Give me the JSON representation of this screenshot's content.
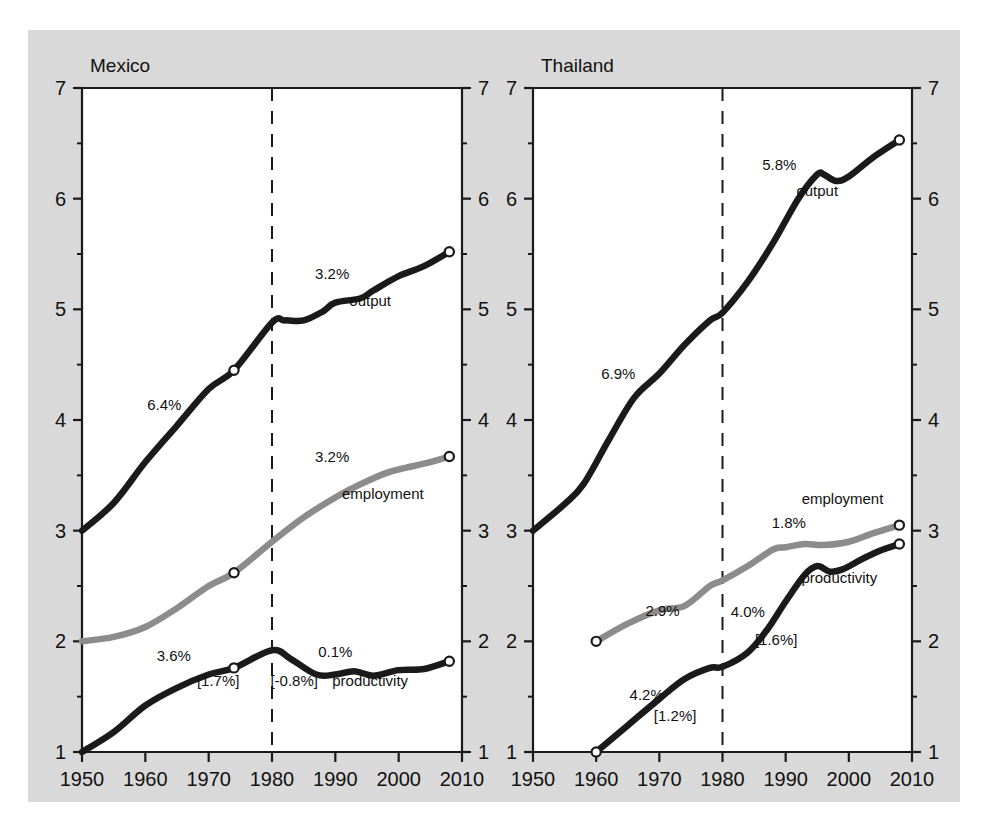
{
  "figure": {
    "background_color": "#d9d9d9",
    "plot_background_color": "#ffffff",
    "dark_line_color": "#1a1a1a",
    "gray_line_color": "#8c8c8c",
    "axis_color": "#1a1a1a"
  },
  "chart_data": [
    {
      "type": "line",
      "title": "Mexico",
      "xlabel": "",
      "ylabel": "",
      "xlim": [
        1950,
        2010
      ],
      "ylim": [
        1,
        7
      ],
      "grid": false,
      "legend": "inline-labels",
      "xticks": [
        1950,
        1960,
        1970,
        1980,
        1990,
        2000,
        2010
      ],
      "xtick_labels": [
        "1950",
        "1960",
        "1970",
        "1980",
        "1990",
        "2000",
        "2010"
      ],
      "yticks": [
        1,
        2,
        3,
        4,
        5,
        6,
        7
      ],
      "ytick_labels": [
        "1",
        "2",
        "3",
        "4",
        "5",
        "6",
        "7"
      ],
      "minor_yticks": [
        1.5,
        2.5,
        3.5,
        4.5,
        5.5,
        6.5
      ],
      "vertical_reference_line": 1980,
      "series": [
        {
          "name": "output",
          "color": "#1a1a1a",
          "x": [
            1950,
            1955,
            1960,
            1965,
            1970,
            1974,
            1980,
            1982,
            1985,
            1988,
            1990,
            1994,
            1996,
            2000,
            2004,
            2008
          ],
          "values": [
            3.0,
            3.25,
            3.62,
            3.95,
            4.28,
            4.45,
            4.88,
            4.9,
            4.9,
            4.98,
            5.06,
            5.1,
            5.17,
            5.3,
            5.39,
            5.52
          ]
        },
        {
          "name": "employment",
          "color": "#8c8c8c",
          "x": [
            1950,
            1955,
            1960,
            1965,
            1970,
            1974,
            1980,
            1985,
            1990,
            1994,
            1998,
            2002,
            2005,
            2008
          ],
          "values": [
            2.0,
            2.04,
            2.13,
            2.3,
            2.5,
            2.62,
            2.9,
            3.12,
            3.3,
            3.42,
            3.52,
            3.58,
            3.62,
            3.67
          ]
        },
        {
          "name": "productivity",
          "color": "#1a1a1a",
          "x": [
            1950,
            1955,
            1960,
            1965,
            1970,
            1974,
            1980,
            1983,
            1987,
            1990,
            1993,
            1996,
            2000,
            2004,
            2008
          ],
          "values": [
            1.0,
            1.18,
            1.42,
            1.58,
            1.7,
            1.76,
            1.92,
            1.84,
            1.7,
            1.7,
            1.73,
            1.69,
            1.74,
            1.75,
            1.82
          ]
        }
      ],
      "markers": [
        {
          "series": "output",
          "x": 1974,
          "y": 4.45
        },
        {
          "series": "output",
          "x": 2008,
          "y": 5.52
        },
        {
          "series": "employment",
          "x": 1974,
          "y": 2.62
        },
        {
          "series": "employment",
          "x": 2008,
          "y": 3.67
        },
        {
          "series": "productivity",
          "x": 1974,
          "y": 1.76
        },
        {
          "series": "productivity",
          "x": 2008,
          "y": 1.82
        }
      ],
      "annotations": [
        {
          "text": "6.4%",
          "x": 1963.0,
          "y": 4.09,
          "series": "output"
        },
        {
          "text": "3.2%",
          "x": 1989.5,
          "y": 5.27,
          "series": "output"
        },
        {
          "text": "output",
          "x": 1995.5,
          "y": 5.03,
          "series": "output"
        },
        {
          "text": "3.2%",
          "x": 1989.5,
          "y": 3.62,
          "series": "employment"
        },
        {
          "text": "employment",
          "x": 1997.5,
          "y": 3.29,
          "series": "employment"
        },
        {
          "text": "3.6%",
          "x": 1964.5,
          "y": 1.82,
          "series": "productivity"
        },
        {
          "text": "[1.7%]",
          "x": 1971.5,
          "y": 1.6,
          "series": "productivity"
        },
        {
          "text": "0.1%",
          "x": 1990.0,
          "y": 1.86,
          "series": "productivity"
        },
        {
          "text": "[-0.8%]",
          "x": 1983.5,
          "y": 1.6,
          "series": "productivity"
        },
        {
          "text": "productivity",
          "x": 1995.5,
          "y": 1.6,
          "series": "productivity"
        }
      ]
    },
    {
      "type": "line",
      "title": "Thailand",
      "xlabel": "",
      "ylabel": "",
      "xlim": [
        1950,
        2010
      ],
      "ylim": [
        1,
        7
      ],
      "grid": false,
      "legend": "inline-labels",
      "xticks": [
        1950,
        1960,
        1970,
        1980,
        1990,
        2000,
        2010
      ],
      "xtick_labels": [
        "1950",
        "1960",
        "1970",
        "1980",
        "1990",
        "2000",
        "2010"
      ],
      "yticks": [
        1,
        2,
        3,
        4,
        5,
        6,
        7
      ],
      "ytick_labels": [
        "1",
        "2",
        "3",
        "4",
        "5",
        "6",
        "7"
      ],
      "minor_yticks": [
        1.5,
        2.5,
        3.5,
        4.5,
        5.5,
        6.5
      ],
      "vertical_reference_line": 1980,
      "series": [
        {
          "name": "output",
          "color": "#1a1a1a",
          "x": [
            1950,
            1955,
            1958,
            1962,
            1966,
            1970,
            1974,
            1978,
            1980,
            1984,
            1988,
            1992,
            1995,
            1996,
            1998,
            2000,
            2004,
            2008
          ],
          "values": [
            3.0,
            3.24,
            3.42,
            3.82,
            4.2,
            4.42,
            4.68,
            4.9,
            4.97,
            5.25,
            5.6,
            6.0,
            6.22,
            6.22,
            6.16,
            6.2,
            6.38,
            6.53
          ]
        },
        {
          "name": "employment",
          "color": "#8c8c8c",
          "x": [
            1960,
            1965,
            1970,
            1974,
            1978,
            1980,
            1984,
            1988,
            1990,
            1993,
            1996,
            2000,
            2004,
            2008
          ],
          "values": [
            2.0,
            2.16,
            2.28,
            2.32,
            2.5,
            2.55,
            2.68,
            2.83,
            2.85,
            2.88,
            2.87,
            2.9,
            2.98,
            3.05
          ]
        },
        {
          "name": "productivity",
          "color": "#1a1a1a",
          "x": [
            1960,
            1965,
            1970,
            1974,
            1978,
            1980,
            1984,
            1987,
            1990,
            1993,
            1995,
            1997,
            1999,
            2002,
            2005,
            2008
          ],
          "values": [
            1.0,
            1.24,
            1.48,
            1.66,
            1.76,
            1.77,
            1.9,
            2.1,
            2.36,
            2.6,
            2.68,
            2.63,
            2.65,
            2.74,
            2.82,
            2.88
          ]
        }
      ],
      "markers": [
        {
          "series": "output",
          "x": 2008,
          "y": 6.53
        },
        {
          "series": "employment",
          "x": 1960,
          "y": 2.0
        },
        {
          "series": "employment",
          "x": 2008,
          "y": 3.05
        },
        {
          "series": "productivity",
          "x": 1960,
          "y": 1.0
        },
        {
          "series": "productivity",
          "x": 2008,
          "y": 2.88
        }
      ],
      "annotations": [
        {
          "text": "6.9%",
          "x": 1963.5,
          "y": 4.37,
          "series": "output"
        },
        {
          "text": "5.8%",
          "x": 1989.0,
          "y": 6.26,
          "series": "output"
        },
        {
          "text": "output",
          "x": 1995.0,
          "y": 6.02,
          "series": "output"
        },
        {
          "text": "employment",
          "x": 1999.0,
          "y": 3.24,
          "series": "employment"
        },
        {
          "text": "1.8%",
          "x": 1990.5,
          "y": 3.02,
          "series": "employment"
        },
        {
          "text": "2.9%",
          "x": 1970.5,
          "y": 2.23,
          "series": "employment"
        },
        {
          "text": "4.0%",
          "x": 1984.0,
          "y": 2.22,
          "series": "productivity"
        },
        {
          "text": "[1.6%]",
          "x": 1988.5,
          "y": 1.97,
          "series": "productivity"
        },
        {
          "text": "productivity",
          "x": 1998.5,
          "y": 2.53,
          "series": "productivity"
        },
        {
          "text": "4.2%",
          "x": 1968.0,
          "y": 1.47,
          "series": "productivity"
        },
        {
          "text": "[1.2%]",
          "x": 1972.5,
          "y": 1.28,
          "series": "productivity"
        }
      ]
    }
  ]
}
